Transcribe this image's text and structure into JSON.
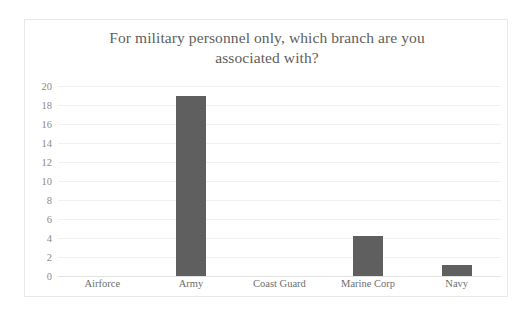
{
  "chart_data": {
    "type": "bar",
    "title": "For military personnel only, which branch are you associated with?",
    "title_line1": "For military personnel only, which branch are you",
    "title_line2": "associated with?",
    "xlabel": "",
    "ylabel": "",
    "categories": [
      "Airforce",
      "Army",
      "Coast Guard",
      "Marine Corp",
      "Navy"
    ],
    "values": [
      0,
      19,
      0,
      4.2,
      1.2
    ],
    "ylim": [
      0,
      20
    ],
    "ytick_step": 2,
    "ytick_labels": [
      "20",
      "18",
      "16",
      "14",
      "12",
      "10",
      "8",
      "6",
      "4",
      "2",
      "0"
    ],
    "ytick_values": [
      20,
      18,
      16,
      14,
      12,
      10,
      8,
      6,
      4,
      2,
      0
    ],
    "grid": true,
    "grid_axis": "y",
    "legend": false,
    "legend_position": "none",
    "colors": {
      "bar": "#5f5f5f",
      "gridline": "#f0f0f1",
      "axis": "#e2e2e3",
      "title_text": "#5e5e5e",
      "tick_text": "#8b8b8b",
      "category_text": "#6e6e6e",
      "plot_background": "#ffffff",
      "frame_border": "#e9e9ea"
    }
  }
}
